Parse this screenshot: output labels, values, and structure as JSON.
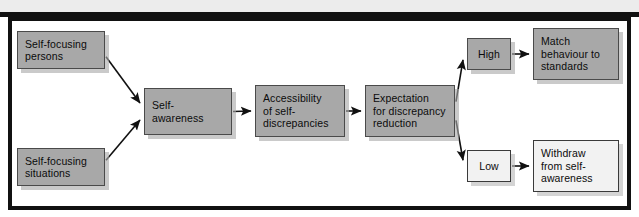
{
  "figure": {
    "type": "flowchart",
    "background_color": "#ffffff",
    "frame_color": "#111111",
    "node_fill_dark": "#a8a8a8",
    "node_fill_light": "#f2f2f2",
    "arrow_color": "#111111"
  },
  "nodes": [
    {
      "id": "self-focusing-persons",
      "label": "Self-focusing\npersons",
      "style": "dark",
      "x": 17,
      "y": 31,
      "w": 88,
      "h": 38
    },
    {
      "id": "self-focusing-situations",
      "label": "Self-focusing\nsituations",
      "style": "dark",
      "x": 17,
      "y": 148,
      "w": 88,
      "h": 38
    },
    {
      "id": "self-awareness",
      "label": "Self-\nawareness",
      "style": "dark",
      "x": 144,
      "y": 88,
      "w": 88,
      "h": 47
    },
    {
      "id": "accessibility-of-self-discrepancies",
      "label": "Accessibility\nof self-\ndiscrepancies",
      "style": "dark",
      "x": 255,
      "y": 85,
      "w": 90,
      "h": 52
    },
    {
      "id": "expectation-for-discrepancy-reduction",
      "label": "Expectation\nfor discrepancy\nreduction",
      "style": "dark",
      "x": 365,
      "y": 85,
      "w": 90,
      "h": 52
    },
    {
      "id": "high",
      "label": "High",
      "style": "dark",
      "x": 467,
      "y": 38,
      "w": 44,
      "h": 32,
      "center": true
    },
    {
      "id": "low",
      "label": "Low",
      "style": "light",
      "x": 467,
      "y": 150,
      "w": 44,
      "h": 32,
      "center": true
    },
    {
      "id": "match-behaviour-to-standards",
      "label": "Match\nbehaviour to\nstandards",
      "style": "dark",
      "x": 533,
      "y": 28,
      "w": 86,
      "h": 52
    },
    {
      "id": "withdraw-from-self-awareness",
      "label": "Withdraw\nfrom self-\nawareness",
      "style": "light",
      "x": 533,
      "y": 140,
      "w": 86,
      "h": 52
    }
  ],
  "edges": [
    {
      "id": "persons-to-awareness",
      "from": "self-focusing-persons",
      "to": "self-awareness"
    },
    {
      "id": "situations-to-awareness",
      "from": "self-focusing-situations",
      "to": "self-awareness"
    },
    {
      "id": "awareness-to-accessibility",
      "from": "self-awareness",
      "to": "accessibility-of-self-discrepancies"
    },
    {
      "id": "accessibility-to-expectation",
      "from": "accessibility-of-self-discrepancies",
      "to": "expectation-for-discrepancy-reduction"
    },
    {
      "id": "expectation-to-high",
      "from": "expectation-for-discrepancy-reduction",
      "to": "high"
    },
    {
      "id": "expectation-to-low",
      "from": "expectation-for-discrepancy-reduction",
      "to": "low"
    },
    {
      "id": "high-to-match",
      "from": "high",
      "to": "match-behaviour-to-standards"
    },
    {
      "id": "low-to-withdraw",
      "from": "low",
      "to": "withdraw-from-self-awareness"
    }
  ]
}
